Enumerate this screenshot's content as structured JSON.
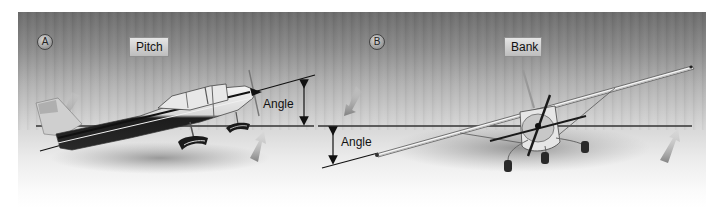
{
  "figure": {
    "panels": [
      {
        "id": "A",
        "badge": "A",
        "title": "Pitch",
        "angle_label": "Angle",
        "description": "Side view of a high-wing airplane pitched nose-up; angle between longitudinal axis and horizon"
      },
      {
        "id": "B",
        "badge": "B",
        "title": "Bank",
        "angle_label": "Angle",
        "description": "Front view of a high-wing airplane banked; angle between wing line and horizon"
      }
    ],
    "colors": {
      "background_top": "#6c6c6c",
      "background_bottom": "#ffffff",
      "line": "#1a1a1a",
      "label_box": "#d0d0d0"
    }
  }
}
